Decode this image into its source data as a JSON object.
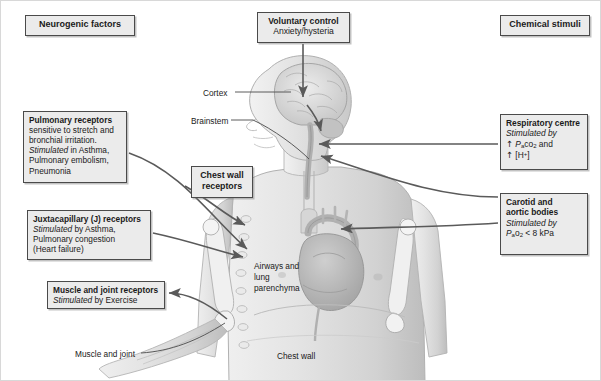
{
  "figure": {
    "colors": {
      "box_fill": "#ebebeb",
      "box_border": "#4a4a4a",
      "arrow": "#5a5a5a",
      "body_light": "#e8e8e8",
      "body_mid": "#cfcfcf",
      "body_dark": "#a8a8a8",
      "text": "#1a1a1a"
    }
  },
  "headings": {
    "neurogenic": "Neurogenic factors",
    "chemical": "Chemical stimuli"
  },
  "boxes": {
    "voluntary": {
      "title": "Voluntary control",
      "line1": "Anxiety/hysteria"
    },
    "pulmonary": {
      "title": "Pulmonary receptors",
      "line1": "sensitive to stretch and",
      "line2": "bronchial irritation.",
      "line3_italic": "Stimulated",
      "line3_rest": " in Asthma,",
      "line4": "Pulmonary embolism,",
      "line5": "Pneumonia"
    },
    "juxtacapillary": {
      "title": "Juxtacapillary (J) receptors",
      "line1_italic": "Stimulated",
      "line1_rest": " by Asthma,",
      "line2": "Pulmonary congestion",
      "line3": "(Heart failure)"
    },
    "muscle_joint": {
      "title": "Muscle and joint receptors",
      "line1_italic": "Stimulated",
      "line1_rest": " by Exercise"
    },
    "chest_wall": {
      "title_line1": "Chest wall",
      "title_line2": "receptors"
    },
    "respiratory_centre": {
      "title": "Respiratory centre",
      "line1_italic": "Stimulated by",
      "line2_arrow": "↑",
      "line2_sym_p": "P",
      "line2_sym_a": "a",
      "line2_sym_co": "co",
      "line2_sym_2": "2",
      "line2_tail": " and",
      "line3_arrow": "↑",
      "line3_text": "[H",
      "line3_sup": "+",
      "line3_tail": "]"
    },
    "carotid": {
      "title_line1": "Carotid and",
      "title_line2": "aortic bodies",
      "line1_italic": "Stimulated by",
      "line2_sym_p": "P",
      "line2_sym_a": "a",
      "line2_sym_o": "o",
      "line2_sym_2": "2",
      "line2_tail": " < 8 kPa"
    }
  },
  "anatomy_labels": {
    "cortex": "Cortex",
    "brainstem": "Brainstem",
    "airways": "Airways and lung parenchyma",
    "chest_wall": "Chest wall",
    "muscle_and_joint": "Muscle and joint"
  }
}
